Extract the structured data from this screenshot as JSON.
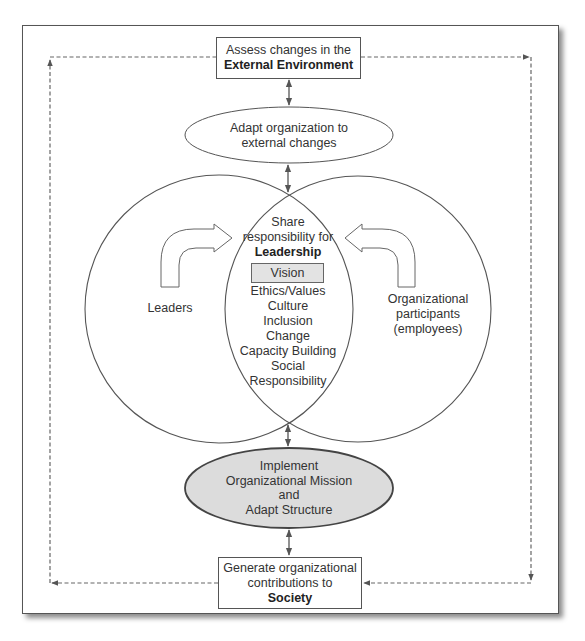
{
  "diagram": {
    "top_box": {
      "line1": "Assess changes in the",
      "line2": "External Environment"
    },
    "top_ellipse": {
      "line1": "Adapt organization to",
      "line2": "external changes"
    },
    "left_circle": {
      "label": "Leaders"
    },
    "right_circle": {
      "line1": "Organizational",
      "line2": "participants",
      "line3": "(employees)"
    },
    "intersection": {
      "line1": "Share",
      "line2": "responsibility for",
      "heading": "Leadership",
      "highlight": "Vision",
      "items": [
        "Ethics/Values",
        "Culture",
        "Inclusion",
        "Change",
        "Capacity Building",
        "Social",
        "Responsibility"
      ]
    },
    "bottom_ellipse": {
      "line1": "Implement",
      "line2": "Organizational Mission",
      "line3": "and",
      "line4": "Adapt Structure"
    },
    "bottom_box": {
      "line1": "Generate organizational",
      "line2": "contributions to",
      "line3": "Society"
    },
    "colors": {
      "stroke": "#555555",
      "bottom_ellipse_fill": "#dcdcdc",
      "vision_fill": "#e3e3e3",
      "dashed": "#666666"
    }
  }
}
